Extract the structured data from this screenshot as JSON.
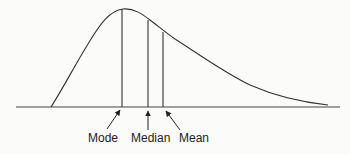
{
  "diagram": {
    "labels": {
      "mode": "Mode",
      "median": "Median",
      "mean": "Mean"
    },
    "colors": {
      "line": "#333333",
      "background": "#fbfbf9",
      "text": "#222222"
    },
    "markers": [
      {
        "name": "Mode",
        "x": 122,
        "top_y": 9
      },
      {
        "name": "Median",
        "x": 148,
        "top_y": 20
      },
      {
        "name": "Mean",
        "x": 163,
        "top_y": 32
      }
    ],
    "baseline": {
      "x1": 16,
      "x2": 340,
      "y": 107
    }
  }
}
